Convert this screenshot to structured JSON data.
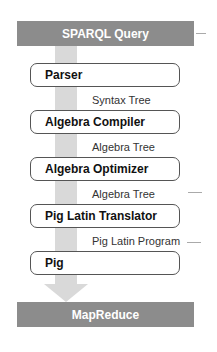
{
  "diagram": {
    "type": "pipeline",
    "input": "SPARQL Query",
    "output": "MapReduce",
    "stages": [
      {
        "label": "Parser"
      },
      {
        "label": "Algebra Compiler"
      },
      {
        "label": "Algebra Optimizer"
      },
      {
        "label": "Pig Latin Translator"
      },
      {
        "label": "Pig"
      }
    ],
    "edges": [
      {
        "label": "Syntax Tree"
      },
      {
        "label": "Algebra Tree"
      },
      {
        "label": "Algebra Tree"
      },
      {
        "label": "Pig Latin Program"
      }
    ],
    "colors": {
      "bar": "#8c8c8c",
      "arrow": "#d9d9d9",
      "stage_border": "#555555"
    }
  }
}
